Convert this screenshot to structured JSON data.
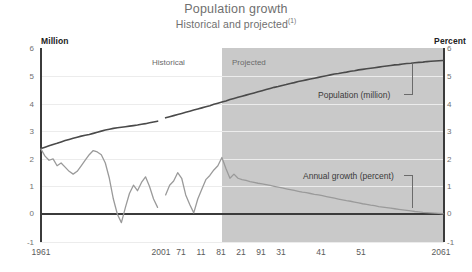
{
  "chart_data": {
    "type": "line",
    "title": "Population growth",
    "subtitle": "Historical and projected",
    "subtitle_note": "(1)",
    "xlabel": "",
    "ylabel_left": "Million",
    "ylabel_right": "Percent",
    "ylim": [
      -1,
      6
    ],
    "xlim": [
      1961,
      2061
    ],
    "grid": true,
    "legend_position": "inline-annotations",
    "y_ticks_left": [
      "6",
      "5",
      "4",
      "3",
      "2",
      "1",
      "0",
      "-1"
    ],
    "y_ticks_right": [
      "6",
      "5",
      "4",
      "3",
      "2",
      "1",
      "0",
      "-1"
    ],
    "x_ticks": [
      "1961",
      "71",
      "81",
      "91",
      "2001",
      "11",
      "21",
      "31",
      "41",
      "51",
      "2061"
    ],
    "x_tick_values": [
      1961,
      1971,
      1981,
      1991,
      2001,
      2011,
      2021,
      2031,
      2041,
      2051,
      2061
    ],
    "regions": [
      {
        "label": "Historical",
        "start": 1961,
        "end": 2006
      },
      {
        "label": "Projected",
        "start": 2006,
        "end": 2061
      }
    ],
    "annotations": [
      {
        "text": "Population (million)",
        "series": "population"
      },
      {
        "text": "Annual growth (percent)",
        "series": "annual_growth"
      }
    ],
    "series": [
      {
        "name": "Population (million)",
        "unit": "million",
        "axis": "left",
        "color": "#4a4a4a",
        "x": [
          1961,
          1962,
          1963,
          1964,
          1965,
          1966,
          1967,
          1968,
          1969,
          1970,
          1971,
          1972,
          1973,
          1974,
          1975,
          1976,
          1977,
          1978,
          1979,
          1980,
          1981,
          1982,
          1983,
          1984,
          1985,
          1986,
          1987,
          1988,
          1989,
          1990,
          1991,
          1992,
          1993,
          1994,
          1995,
          1996,
          1997,
          1998,
          1999,
          2000,
          2001,
          2002,
          2003,
          2004,
          2005,
          2006,
          2007,
          2008,
          2009,
          2010,
          2011,
          2012,
          2013,
          2014,
          2015,
          2016,
          2017,
          2018,
          2019,
          2020,
          2021,
          2022,
          2023,
          2024,
          2025,
          2026,
          2027,
          2028,
          2029,
          2030,
          2031,
          2032,
          2033,
          2034,
          2035,
          2036,
          2037,
          2038,
          2039,
          2040,
          2041,
          2042,
          2043,
          2044,
          2045,
          2046,
          2047,
          2048,
          2049,
          2050,
          2051,
          2052,
          2053,
          2054,
          2055,
          2056,
          2057,
          2058,
          2059,
          2060,
          2061
        ],
        "values": [
          2.37,
          2.42,
          2.47,
          2.52,
          2.56,
          2.61,
          2.66,
          2.7,
          2.74,
          2.78,
          2.82,
          2.85,
          2.88,
          2.92,
          2.96,
          3.0,
          3.04,
          3.07,
          3.1,
          3.12,
          3.14,
          3.16,
          3.18,
          3.2,
          3.22,
          3.25,
          3.27,
          3.3,
          3.33,
          3.36,
          null,
          3.48,
          3.52,
          3.56,
          3.6,
          3.64,
          3.68,
          3.72,
          3.76,
          3.8,
          3.84,
          3.88,
          3.92,
          3.97,
          4.01,
          4.05,
          4.09,
          4.14,
          4.18,
          4.22,
          4.26,
          4.3,
          4.34,
          4.38,
          4.42,
          4.46,
          4.5,
          4.54,
          4.58,
          4.61,
          4.65,
          4.68,
          4.72,
          4.75,
          4.79,
          4.82,
          4.85,
          4.88,
          4.91,
          4.94,
          4.97,
          5.0,
          5.03,
          5.06,
          5.08,
          5.11,
          5.13,
          5.16,
          5.18,
          5.21,
          5.23,
          5.25,
          5.27,
          5.29,
          5.31,
          5.33,
          5.35,
          5.37,
          5.39,
          5.4,
          5.42,
          5.44,
          5.45,
          5.47,
          5.48,
          5.49,
          5.51,
          5.52,
          5.53,
          5.54,
          5.55
        ]
      },
      {
        "name": "Annual growth (percent)",
        "unit": "percent",
        "axis": "right",
        "color": "#9a9a9a",
        "x": [
          1961,
          1962,
          1963,
          1964,
          1965,
          1966,
          1967,
          1968,
          1969,
          1970,
          1971,
          1972,
          1973,
          1974,
          1975,
          1976,
          1977,
          1978,
          1979,
          1980,
          1981,
          1982,
          1983,
          1984,
          1985,
          1986,
          1987,
          1988,
          1989,
          1990,
          1991,
          1992,
          1993,
          1994,
          1995,
          1996,
          1997,
          1998,
          1999,
          2000,
          2001,
          2002,
          2003,
          2004,
          2005,
          2006,
          2007,
          2008,
          2009,
          2010,
          2011,
          2012,
          2013,
          2014,
          2015,
          2016,
          2017,
          2018,
          2019,
          2020,
          2021,
          2022,
          2023,
          2024,
          2025,
          2026,
          2027,
          2028,
          2029,
          2030,
          2031,
          2032,
          2033,
          2034,
          2035,
          2036,
          2037,
          2038,
          2039,
          2040,
          2041,
          2042,
          2043,
          2044,
          2045,
          2046,
          2047,
          2048,
          2049,
          2050,
          2051,
          2052,
          2053,
          2054,
          2055,
          2056,
          2057,
          2058,
          2059,
          2060,
          2061
        ],
        "values": [
          2.35,
          2.1,
          1.95,
          2.0,
          1.75,
          1.85,
          1.7,
          1.55,
          1.45,
          1.55,
          1.75,
          1.95,
          2.15,
          2.3,
          2.25,
          2.15,
          1.85,
          1.3,
          0.55,
          0.0,
          -0.3,
          0.25,
          0.75,
          1.05,
          0.85,
          1.15,
          1.35,
          1.0,
          0.55,
          0.25,
          null,
          0.7,
          1.05,
          1.2,
          1.5,
          1.3,
          0.7,
          0.35,
          0.05,
          0.55,
          0.9,
          1.25,
          1.4,
          1.6,
          1.75,
          2.05,
          1.65,
          1.3,
          1.45,
          1.3,
          1.25,
          1.22,
          1.18,
          1.15,
          1.12,
          1.1,
          1.07,
          1.04,
          1.01,
          0.98,
          0.95,
          0.92,
          0.89,
          0.86,
          0.83,
          0.8,
          0.78,
          0.75,
          0.72,
          0.7,
          0.67,
          0.64,
          0.61,
          0.58,
          0.55,
          0.52,
          0.49,
          0.47,
          0.44,
          0.41,
          0.38,
          0.36,
          0.33,
          0.31,
          0.28,
          0.26,
          0.24,
          0.22,
          0.2,
          0.18,
          0.16,
          0.14,
          0.12,
          0.1,
          0.09,
          0.07,
          0.06,
          0.05,
          0.04,
          0.03,
          0.02
        ]
      }
    ]
  }
}
